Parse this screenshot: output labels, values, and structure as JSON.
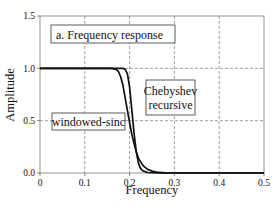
{
  "chart_data": {
    "type": "line",
    "title": "a.  Frequency response",
    "xlabel": "Frequency",
    "ylabel": "Amplitude",
    "xlim": [
      0,
      0.5
    ],
    "ylim": [
      0,
      1.5
    ],
    "grid": true,
    "x_ticks": [
      "0",
      "0.1",
      "0.2",
      "0.3",
      "0.4",
      "0.5"
    ],
    "y_ticks": [
      "0.0",
      "0.5",
      "1.0",
      "1.5"
    ],
    "annotations": [
      {
        "text_lines": [
          "Chebyshev",
          "recursive"
        ],
        "x": 0.255,
        "y": 0.78
      },
      {
        "text_lines": [
          "windowed-sinc"
        ],
        "x": 0.07,
        "y": 0.5
      }
    ],
    "series": [
      {
        "name": "Chebyshev recursive",
        "x": [
          0,
          0.1,
          0.17,
          0.185,
          0.19,
          0.195,
          0.2,
          0.205,
          0.21,
          0.215,
          0.22,
          0.225,
          0.23,
          0.24,
          0.26,
          0.3,
          0.4,
          0.5
        ],
        "y": [
          1.0,
          1.0,
          1.0,
          1.0,
          0.99,
          0.95,
          0.82,
          0.6,
          0.38,
          0.2,
          0.09,
          0.04,
          0.02,
          0.005,
          0.0,
          0.0,
          0.0,
          0.0
        ]
      },
      {
        "name": "windowed-sinc",
        "x": [
          0,
          0.1,
          0.16,
          0.17,
          0.175,
          0.18,
          0.185,
          0.19,
          0.195,
          0.2,
          0.205,
          0.21,
          0.215,
          0.22,
          0.23,
          0.24,
          0.25,
          0.26,
          0.28,
          0.3,
          0.4,
          0.5
        ],
        "y": [
          1.0,
          1.0,
          1.0,
          0.99,
          0.97,
          0.92,
          0.84,
          0.72,
          0.6,
          0.48,
          0.37,
          0.28,
          0.2,
          0.14,
          0.07,
          0.035,
          0.018,
          0.008,
          0.002,
          0.0,
          0.0,
          0.0
        ]
      }
    ]
  }
}
